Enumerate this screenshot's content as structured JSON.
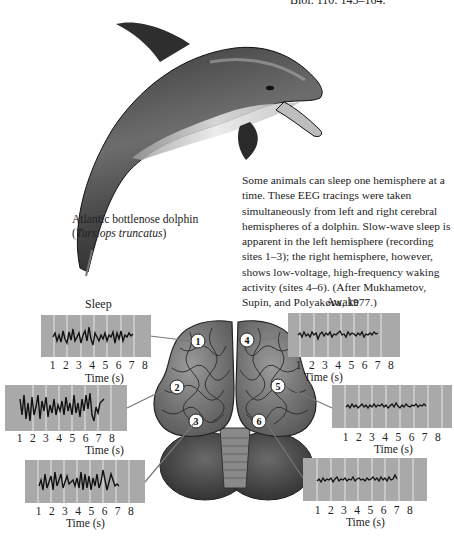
{
  "reference_fragment": "Biol. 110: 145–164.",
  "dolphin": {
    "common_name": "Atlantic bottlenose dolphin",
    "sci_open": "(",
    "scientific_name": "Tursiops truncatus",
    "sci_close": ")"
  },
  "caption": "Some animals can sleep one hemisphere at a time. These EEG tracings were taken simultaneously from left and right cerebral hemispheres of a dolphin. Slow-wave sleep is apparent in the left hemisphere (recording sites 1–3); the right hemisphere, however, shows low-voltage, high-frequency waking activity (sites 4–6). (After Mukhametov, Supin, and Polyakova, 1977.)",
  "figure": {
    "left_header": "Sleep",
    "right_header": "Awake",
    "time_label": "Time (s)",
    "tick_labels": [
      "1",
      "2",
      "3",
      "4",
      "5",
      "6",
      "7",
      "8"
    ],
    "trace_bg_color": "#a9a9a9",
    "trace_line_color": "#111111",
    "sites": [
      {
        "id": "1",
        "hemisphere": "left",
        "state": "Sleep"
      },
      {
        "id": "2",
        "hemisphere": "left",
        "state": "Sleep"
      },
      {
        "id": "3",
        "hemisphere": "left",
        "state": "Sleep"
      },
      {
        "id": "4",
        "hemisphere": "right",
        "state": "Awake"
      },
      {
        "id": "5",
        "hemisphere": "right",
        "state": "Awake"
      },
      {
        "id": "6",
        "hemisphere": "right",
        "state": "Awake"
      }
    ]
  }
}
